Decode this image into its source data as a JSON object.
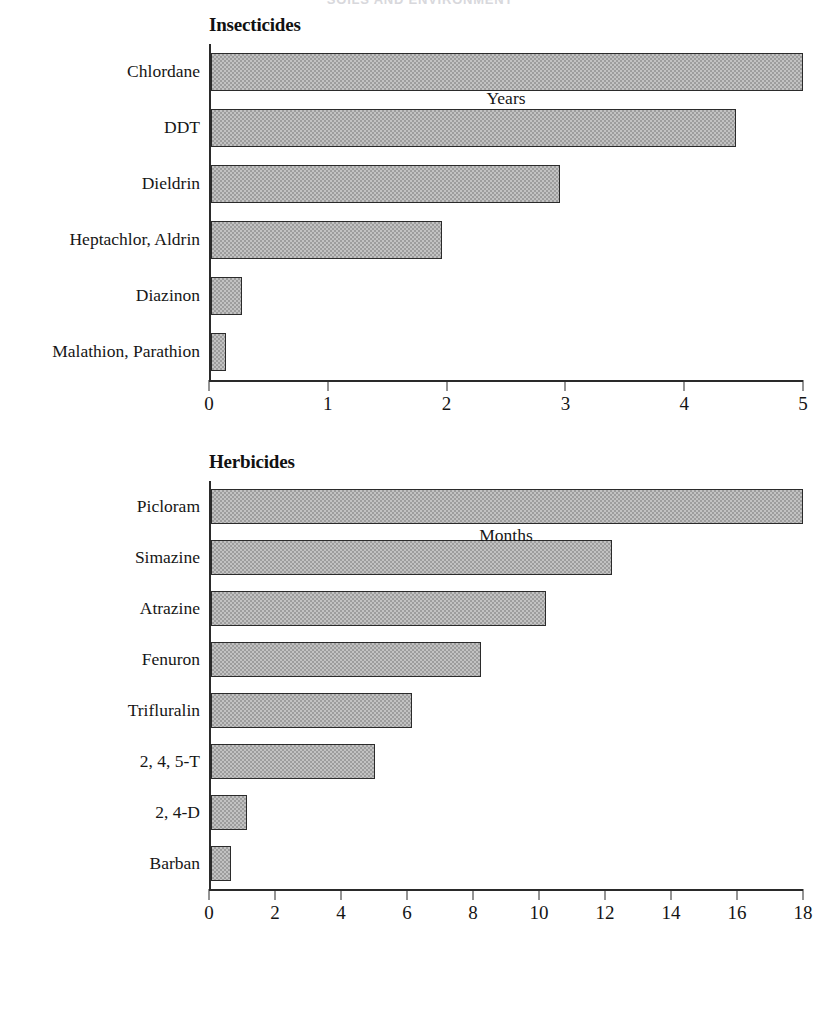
{
  "page": {
    "running_head": "SOILS AND ENVIRONMENT"
  },
  "figures": [
    {
      "id": "insecticides",
      "title": "Insecticides",
      "axis_title": "Years",
      "ticks": [
        "0",
        "1",
        "2",
        "3",
        "4",
        "5"
      ]
    },
    {
      "id": "herbicides",
      "title": "Herbicides",
      "axis_title": "Months",
      "ticks": [
        "0",
        "2",
        "4",
        "6",
        "8",
        "10",
        "12",
        "14",
        "16",
        "18"
      ]
    }
  ],
  "chart_data": [
    {
      "type": "bar",
      "orientation": "horizontal",
      "title": "Insecticides",
      "xlabel": "Years",
      "ylabel": "",
      "xlim": [
        0,
        5
      ],
      "xticks": [
        0,
        1,
        2,
        3,
        4,
        5
      ],
      "grid": false,
      "legend": "none",
      "categories": [
        "Chlordane",
        "DDT",
        "Dieldrin",
        "Heptachlor, Aldrin",
        "Diazinon",
        "Malathion, Parathion"
      ],
      "values": [
        5.0,
        4.43,
        2.95,
        1.95,
        0.26,
        0.13
      ],
      "bar_color": "#c2c2c2",
      "bar_edge_color": "#2b2b2b"
    },
    {
      "type": "bar",
      "orientation": "horizontal",
      "title": "Herbicides",
      "xlabel": "Months",
      "ylabel": "",
      "xlim": [
        0,
        18
      ],
      "xticks": [
        0,
        2,
        4,
        6,
        8,
        10,
        12,
        14,
        16,
        18
      ],
      "grid": false,
      "legend": "none",
      "categories": [
        "Picloram",
        "Simazine",
        "Atrazine",
        "Fenuron",
        "Trifluralin",
        "2, 4, 5-T",
        "2, 4-D",
        "Barban"
      ],
      "values": [
        18.0,
        12.2,
        10.2,
        8.2,
        6.1,
        5.0,
        1.1,
        0.6
      ],
      "bar_color": "#c2c2c2",
      "bar_edge_color": "#2b2b2b"
    }
  ]
}
